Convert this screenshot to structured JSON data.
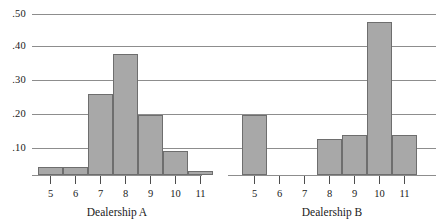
{
  "chart_data": {
    "type": "bar",
    "title": "",
    "xlabel": "",
    "ylabel": "",
    "ylim": [
      0,
      0.5
    ],
    "grid": true,
    "legend": "none",
    "y_ticks": [
      ".50",
      ".40",
      ".30",
      ".20",
      ".10"
    ],
    "y_tick_values": [
      0.5,
      0.4,
      0.3,
      0.2,
      0.1
    ],
    "categories": [
      "5",
      "6",
      "7",
      "8",
      "9",
      "10",
      "11"
    ],
    "panels": [
      {
        "label": "Dealership A",
        "values": [
          0.025,
          0.025,
          0.25,
          0.375,
          0.1875,
          0.075,
          0.0125
        ]
      },
      {
        "label": "Dealership B",
        "values": [
          0.1875,
          0.0,
          0.0,
          0.1125,
          0.125,
          0.475,
          0.125
        ]
      }
    ],
    "colors": {
      "bar_fill": "#a8a8a8",
      "bar_stroke": "#6e6e6e",
      "gridline": "#8d8d8d",
      "text": "#1a1a1a"
    }
  }
}
